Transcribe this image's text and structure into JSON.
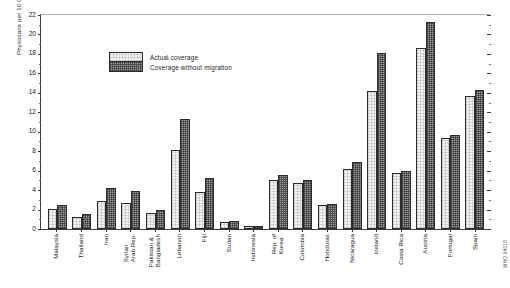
{
  "chart_data": {
    "type": "bar",
    "title": "",
    "xlabel": "",
    "ylabel": "Physicians per 10 000 population",
    "ylim": [
      0,
      22
    ],
    "ytick_step": 2,
    "yticks": [
      0,
      2,
      4,
      6,
      8,
      10,
      12,
      14,
      16,
      18,
      20,
      22
    ],
    "ytick_labels": [
      "0",
      "2",
      "4",
      "6",
      "8",
      "10",
      "12",
      "14",
      "16",
      "18",
      "20",
      "22"
    ],
    "grid": false,
    "legend_position": "top-left",
    "categories": [
      "Malaysia",
      "Thailand",
      "Iran",
      "Syrian\nArab Rep.",
      "Pakistan &\nBangladesh",
      "Lebanon",
      "Fiji",
      "Sudan",
      "Indonesia",
      "Rep. of\nKorea",
      "Colombia",
      "Honduras",
      "Nicaragua",
      "Iceland",
      "Costa Rica",
      "Austria",
      "Portugal",
      "Spain"
    ],
    "series": [
      {
        "name": "Actual coverage",
        "values": [
          2.0,
          1.2,
          2.9,
          2.6,
          1.6,
          8.0,
          3.8,
          0.7,
          0.3,
          5.0,
          4.7,
          2.4,
          6.1,
          14.1,
          5.7,
          18.4,
          9.3,
          13.5
        ]
      },
      {
        "name": "Coverage without migration",
        "values": [
          2.4,
          1.5,
          4.2,
          3.9,
          1.9,
          11.2,
          5.2,
          0.8,
          0.35,
          5.5,
          5.0,
          2.5,
          6.8,
          17.9,
          5.9,
          21.1,
          9.6,
          14.2
        ]
      }
    ],
    "colors": {
      "actual": "#f2f2f2",
      "without_migration": "#9a9a9a",
      "axis": "#3a3a3a",
      "text": "#1a1a1a"
    }
  },
  "legend": {
    "items": [
      {
        "label": "Actual coverage",
        "key": "actual"
      },
      {
        "label": "Coverage without migration",
        "key": "nomig"
      }
    ]
  },
  "footer": {
    "source_code": "WHO 94018"
  }
}
